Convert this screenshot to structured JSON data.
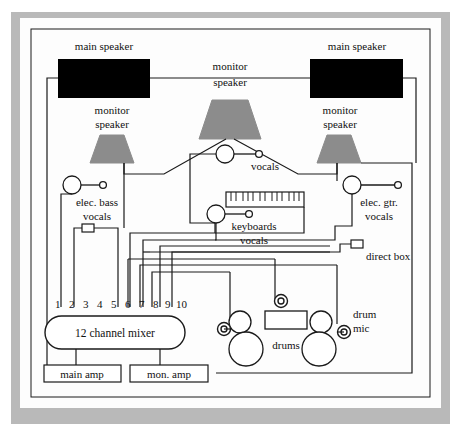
{
  "diagram": {
    "colors": {
      "main_speaker_fill": "#000000",
      "monitor_speaker_fill": "#8c8c8c",
      "cable_stroke": "#1a1a1a",
      "paper_border": "#b9b9b9",
      "paper_background": "#fdfdfd"
    },
    "labels": {
      "main_speaker_left": "main speaker",
      "main_speaker_right": "main speaker",
      "monitor_speaker_center_line1": "monitor",
      "monitor_speaker_center_line2": "speaker",
      "monitor_speaker_left_line1": "monitor",
      "monitor_speaker_left_line2": "speaker",
      "monitor_speaker_right_line1": "monitor",
      "monitor_speaker_right_line2": "speaker",
      "vocals_center": "vocals",
      "elec_bass_line1": "elec. bass",
      "elec_bass_line2": "vocals",
      "elec_gtr_line1": "elec. gtr.",
      "elec_gtr_line2": "vocals",
      "keyboards_line1": "keyboards",
      "keyboards_line2": "vocals",
      "direct_box": "direct box",
      "drums": "drums",
      "drum_mic_line1": "drum",
      "drum_mic_line2": "mic",
      "mixer": "12 channel mixer",
      "main_amp": "main amp",
      "mon_amp": "mon. amp"
    },
    "mixer_channels": [
      "1",
      "2",
      "3",
      "4",
      "5",
      "6",
      "7",
      "8",
      "9",
      "10"
    ],
    "components": [
      {
        "name": "main-speaker-left",
        "type": "main-speaker"
      },
      {
        "name": "main-speaker-right",
        "type": "main-speaker"
      },
      {
        "name": "monitor-speaker-center",
        "type": "monitor-speaker"
      },
      {
        "name": "monitor-speaker-left",
        "type": "monitor-speaker"
      },
      {
        "name": "monitor-speaker-right",
        "type": "monitor-speaker"
      },
      {
        "name": "microphone-vocals-center",
        "type": "microphone"
      },
      {
        "name": "microphone-elec-bass",
        "type": "microphone"
      },
      {
        "name": "microphone-elec-gtr",
        "type": "microphone"
      },
      {
        "name": "microphone-keyboards",
        "type": "microphone"
      },
      {
        "name": "direct-box-left",
        "type": "direct-box"
      },
      {
        "name": "direct-box-right",
        "type": "direct-box"
      },
      {
        "name": "keyboard-instrument",
        "type": "keyboard"
      },
      {
        "name": "drum-kit",
        "type": "drums"
      },
      {
        "name": "drum-mic-left",
        "type": "drum-mic"
      },
      {
        "name": "drum-mic-center",
        "type": "drum-mic"
      },
      {
        "name": "drum-mic-right",
        "type": "drum-mic"
      },
      {
        "name": "mixer",
        "type": "mixer"
      },
      {
        "name": "main-amp",
        "type": "amplifier"
      },
      {
        "name": "mon-amp",
        "type": "amplifier"
      }
    ]
  }
}
